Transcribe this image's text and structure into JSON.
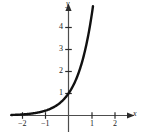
{
  "figure": {
    "background_color": "#ffffff",
    "axis_color": "#4d4d4d",
    "curve_color": "#111111",
    "text_color": "#1a1a1a"
  },
  "axes": {
    "x_label": "x",
    "y_label": "y",
    "x_ticks": [
      {
        "value": -2,
        "label": "−2",
        "px": 22
      },
      {
        "value": -1,
        "label": "−1",
        "px": 45
      },
      {
        "value": 1,
        "label": "1",
        "px": 92
      },
      {
        "value": 2,
        "label": "2",
        "px": 115
      }
    ],
    "y_ticks": [
      {
        "value": 1,
        "label": "1",
        "px": 93
      },
      {
        "value": 2,
        "label": "2",
        "px": 71
      },
      {
        "value": 3,
        "label": "3",
        "px": 49
      },
      {
        "value": 4,
        "label": "4",
        "px": 27
      }
    ]
  },
  "chart_data": {
    "type": "line",
    "title": "",
    "xlabel": "x",
    "ylabel": "y",
    "grid": false,
    "legend": null,
    "xlim": [
      -2.5,
      2.7
    ],
    "ylim": [
      -0.45,
      5.2
    ],
    "xticks": [
      -2,
      -1,
      1,
      2
    ],
    "yticks": [
      1,
      2,
      3,
      4
    ],
    "series": [
      {
        "name": "exponential curve",
        "x": [
          -2.45,
          -2.2,
          -2.0,
          -1.8,
          -1.6,
          -1.4,
          -1.2,
          -1.0,
          -0.8,
          -0.6,
          -0.4,
          -0.2,
          0.0,
          0.15,
          0.3,
          0.45,
          0.6,
          0.75,
          0.9,
          1.0,
          1.05
        ],
        "y": [
          0.07,
          0.09,
          0.12,
          0.15,
          0.2,
          0.26,
          0.33,
          0.43,
          0.55,
          0.71,
          0.92,
          1.18,
          1.0,
          1.3,
          1.68,
          2.1,
          2.6,
          3.25,
          4.0,
          4.55,
          4.75
        ]
      }
    ],
    "annotations": []
  }
}
